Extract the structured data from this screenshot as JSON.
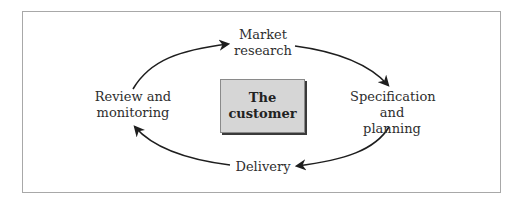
{
  "diagram": {
    "type": "cycle",
    "center": {
      "lines": [
        "The",
        "customer"
      ]
    },
    "nodes": [
      {
        "id": "market-research",
        "lines": [
          "Market",
          "research"
        ],
        "position": "top"
      },
      {
        "id": "specification-planning",
        "lines": [
          "Specification",
          "and planning"
        ],
        "position": "right"
      },
      {
        "id": "delivery",
        "lines": [
          "Delivery"
        ],
        "position": "bottom"
      },
      {
        "id": "review-monitoring",
        "lines": [
          "Review and",
          "monitoring"
        ],
        "position": "left"
      }
    ],
    "edges": [
      {
        "from": "review-monitoring",
        "to": "market-research"
      },
      {
        "from": "market-research",
        "to": "specification-planning"
      },
      {
        "from": "specification-planning",
        "to": "delivery"
      },
      {
        "from": "delivery",
        "to": "review-monitoring"
      }
    ],
    "colors": {
      "box_fill": "#d6d6d6",
      "arrow": "#1e1e1e",
      "frame": "#a8a8a8"
    }
  }
}
